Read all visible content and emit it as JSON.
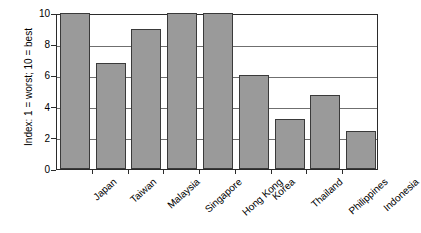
{
  "chart_data": {
    "type": "bar",
    "title": "",
    "xlabel": "",
    "ylabel": "Index: 1 = worst; 10 = best",
    "categories": [
      "Japan",
      "Taiwan",
      "Malaysia",
      "Singapore",
      "Hong Kong",
      "Korea",
      "Thailand",
      "Philippines",
      "Indonesia"
    ],
    "values": [
      10,
      6.8,
      9,
      10,
      10,
      6,
      3.2,
      4.75,
      2.45
    ],
    "ylim": [
      0,
      10
    ],
    "ytick_labels": [
      "0",
      "2",
      "4",
      "6",
      "8",
      "10"
    ],
    "ytick_values": [
      0,
      2,
      4,
      6,
      8,
      10
    ],
    "grid": true,
    "legend": false,
    "bar_color": "#9a9a9a",
    "bar_edge_color": "#3a3a3a",
    "axis_color": "#2b2b2b",
    "gridline_color": "#6f6f6f",
    "background_color": "#ffffff"
  }
}
